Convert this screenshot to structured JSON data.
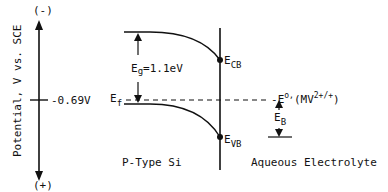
{
  "axis": {
    "label": "Potential, V vs. SCE",
    "top_sign": "(-)",
    "bottom_sign": "(+)",
    "tick_value": "-0.69V"
  },
  "semiconductor": {
    "label": "P-Type Si",
    "fermi_level": {
      "symbol": "E",
      "sub": "f"
    },
    "band_gap": {
      "symbol": "E",
      "sub": "g",
      "value": "=1.1eV"
    }
  },
  "interface": {
    "conduction_band": {
      "symbol": "E",
      "sub": "CB"
    },
    "valence_band": {
      "symbol": "E",
      "sub": "VB"
    }
  },
  "electrolyte": {
    "label": "Aqueous Electrolyte",
    "redox": {
      "symbol": "E",
      "sup": "o,",
      "couple_prefix": "(MV",
      "couple_sup": "2+/+",
      "couple_suffix": ")"
    },
    "barrier": {
      "symbol": "E",
      "sub": "B"
    }
  },
  "colors": {
    "ink": "#111111",
    "background": "#ffffff"
  }
}
